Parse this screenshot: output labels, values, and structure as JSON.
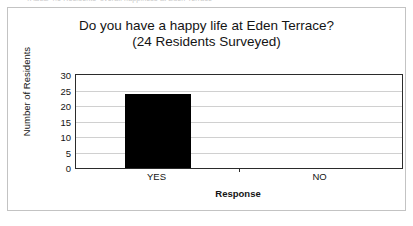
{
  "top_caption": "TABLE 4.1 Residents' overall happiness at Eden Terrace",
  "card": {
    "border_color": "#c3c3c3"
  },
  "chart_data": {
    "type": "bar",
    "title": "Do you have a happy life at Eden Terrace?",
    "subtitle": "(24 Residents Surveyed)",
    "xlabel": "Response",
    "ylabel": "Number of Residents",
    "categories": [
      "YES",
      "NO"
    ],
    "values": [
      24,
      0
    ],
    "ylim": [
      0,
      30
    ],
    "yticks": [
      0,
      5,
      10,
      15,
      20,
      25,
      30
    ],
    "ytick_labels": [
      "0",
      "5",
      "10",
      "15",
      "20",
      "25",
      "30"
    ],
    "grid": true,
    "legend": "none",
    "bar_color": "#000000",
    "axis_color": "#2b2b2b",
    "gridline_color": "#d0d0d0"
  }
}
